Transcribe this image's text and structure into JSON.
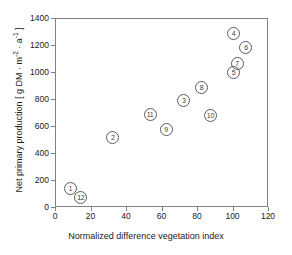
{
  "chart_data": {
    "type": "scatter",
    "title": "",
    "xlabel": "Normalized difference vegetation index",
    "ylabel": "Net primary production [ g DM · m⁻² · a⁻¹ ]",
    "ylabel_parts": {
      "prefix": "Net primary production [ g DM · m",
      "sup1": "-2",
      "middle": " · a",
      "sup2": "-1",
      "suffix": " ]"
    },
    "xlim": [
      0,
      120
    ],
    "ylim": [
      0,
      1400
    ],
    "xticks": [
      0,
      20,
      40,
      60,
      80,
      100,
      120
    ],
    "yticks": [
      0,
      200,
      400,
      600,
      800,
      1000,
      1200,
      1400
    ],
    "grid": false,
    "legend": null,
    "marker": "open-circle-with-number",
    "point_color": "#5a5a5a",
    "points": [
      {
        "label": "1",
        "x": 8,
        "y": 145
      },
      {
        "label": "2",
        "x": 32,
        "y": 520
      },
      {
        "label": "3",
        "x": 72,
        "y": 800
      },
      {
        "label": "4",
        "x": 100,
        "y": 1290
      },
      {
        "label": "5",
        "x": 100,
        "y": 1005
      },
      {
        "label": "6",
        "x": 107,
        "y": 1190
      },
      {
        "label": "7",
        "x": 102,
        "y": 1070
      },
      {
        "label": "8",
        "x": 82,
        "y": 895
      },
      {
        "label": "9",
        "x": 62,
        "y": 585
      },
      {
        "label": "10",
        "x": 87,
        "y": 685
      },
      {
        "label": "11",
        "x": 53,
        "y": 690
      },
      {
        "label": "12",
        "x": 14,
        "y": 80
      }
    ]
  }
}
